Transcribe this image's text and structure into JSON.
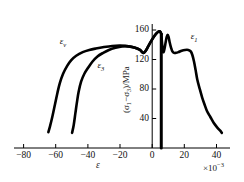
{
  "chart_data": {
    "type": "line",
    "title": "",
    "subtitle": "",
    "xlabel": "ε",
    "x_exponent_prefix": "×10",
    "x_exponent_power": "−3",
    "ylabel": "(σ₁−σ₃)/MPa",
    "ylabel_prefix": "(σ",
    "ylabel_sub1": "1",
    "ylabel_mid": "−σ",
    "ylabel_sub2": "3",
    "ylabel_suffix": ")/MPa",
    "xlim": [
      -90,
      42
    ],
    "ylim": [
      0,
      172
    ],
    "xticks": [
      -80,
      -60,
      -40,
      -20,
      0,
      20,
      40
    ],
    "xtick_labels": [
      "−80",
      "−60",
      "−40",
      "−20",
      "0",
      "20",
      "40"
    ],
    "yticks": [
      40,
      80,
      120,
      160
    ],
    "ytick_labels": [
      "40",
      "80",
      "120",
      "160"
    ],
    "grid": false,
    "legend_position": "inline-annotations",
    "axis_style": "x-axis spine at bottom, y-axis spine at x=0",
    "series": [
      {
        "name": "ε_v",
        "label_text": "ε",
        "label_sub": "v",
        "label_x": -62,
        "label_y": 146,
        "points": [
          [
            -69,
            22
          ],
          [
            -68,
            30
          ],
          [
            -66.5,
            44
          ],
          [
            -65,
            60
          ],
          [
            -63.5,
            76
          ],
          [
            -62,
            90
          ],
          [
            -60,
            103
          ],
          [
            -57.5,
            114
          ],
          [
            -55,
            122
          ],
          [
            -52,
            128
          ],
          [
            -48,
            133
          ],
          [
            -44,
            136
          ],
          [
            -40,
            138
          ],
          [
            -35,
            140
          ],
          [
            -30,
            141.5
          ],
          [
            -25,
            142
          ],
          [
            -20,
            141
          ],
          [
            -16,
            139
          ],
          [
            -13,
            136
          ],
          [
            -11,
            132
          ],
          [
            -9.5,
            135
          ],
          [
            -8,
            141
          ],
          [
            -6,
            149
          ],
          [
            -4,
            156
          ],
          [
            -2.5,
            160
          ],
          [
            -1.2,
            162
          ],
          [
            -0.5,
            161
          ],
          [
            0,
            158
          ]
        ]
      },
      {
        "name": "ε_3",
        "label_text": "ε",
        "label_sub": "3",
        "label_x": -39,
        "label_y": 113,
        "points": [
          [
            -54.5,
            21
          ],
          [
            -53.5,
            32
          ],
          [
            -52.5,
            48
          ],
          [
            -51.5,
            64
          ],
          [
            -50.5,
            78
          ],
          [
            -49,
            92
          ],
          [
            -47,
            103
          ],
          [
            -44.5,
            112
          ],
          [
            -42,
            120
          ],
          [
            -39,
            127
          ],
          [
            -35.5,
            132
          ],
          [
            -32,
            136
          ],
          [
            -28,
            139
          ],
          [
            -24,
            141
          ],
          [
            -20,
            141
          ],
          [
            -16,
            139
          ],
          [
            -13,
            136
          ],
          [
            -11,
            132
          ],
          [
            -9.5,
            135
          ],
          [
            -8,
            141
          ],
          [
            -6,
            149
          ],
          [
            -4,
            156
          ],
          [
            -2.5,
            160
          ],
          [
            -1.2,
            162
          ],
          [
            -0.5,
            161
          ],
          [
            0,
            158
          ]
        ]
      },
      {
        "name": "ε_1",
        "label_text": "ε",
        "label_sub": "1",
        "label_x": 18,
        "label_y": 152,
        "points": [
          [
            0,
            158
          ],
          [
            0.3,
            150
          ],
          [
            0.6,
            142
          ],
          [
            0.9,
            136
          ],
          [
            1.2,
            133
          ],
          [
            1.6,
            134
          ],
          [
            2.1,
            139
          ],
          [
            2.7,
            147
          ],
          [
            3.3,
            154
          ],
          [
            3.9,
            157
          ],
          [
            4.5,
            154
          ],
          [
            5.2,
            146
          ],
          [
            6.0,
            139
          ],
          [
            6.8,
            134
          ],
          [
            7.8,
            132
          ],
          [
            9.0,
            132
          ],
          [
            10.5,
            133
          ],
          [
            12.5,
            135
          ],
          [
            14.5,
            136
          ],
          [
            16.5,
            136
          ],
          [
            18,
            134
          ],
          [
            19,
            129
          ],
          [
            20,
            120
          ],
          [
            21,
            108
          ],
          [
            22,
            95
          ],
          [
            23.5,
            82
          ],
          [
            25,
            70
          ],
          [
            26.5,
            60
          ],
          [
            28,
            51
          ],
          [
            30,
            43
          ],
          [
            32,
            35
          ],
          [
            34,
            29
          ],
          [
            36,
            24
          ],
          [
            37,
            21
          ]
        ]
      },
      {
        "name": "y-axis-drop",
        "label_text": "",
        "label_sub": "",
        "points": [
          [
            0,
            158
          ],
          [
            0,
            0
          ]
        ]
      }
    ]
  },
  "axis_render": {
    "x_axis_y_value": 0,
    "tick_length_px": 4,
    "line_color": "#000000",
    "curve_color": "#000000",
    "curve_width_px": 2.6,
    "axis_width_px": 1.0
  }
}
